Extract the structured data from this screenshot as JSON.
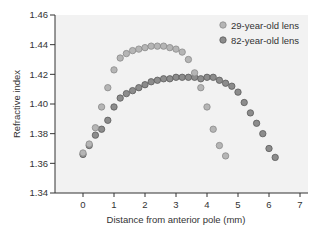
{
  "chart_data": {
    "type": "scatter",
    "title": "",
    "xlabel": "Distance from anterior pole (mm)",
    "ylabel": "Refractive index",
    "xlim": [
      -0.9,
      7
    ],
    "ylim": [
      1.34,
      1.46
    ],
    "x_ticks": [
      "0",
      "1",
      "2",
      "3",
      "4",
      "5",
      "6",
      "7"
    ],
    "y_ticks": [
      "1.34",
      "1.36",
      "1.38",
      "1.40",
      "1.42",
      "1.44",
      "1.46"
    ],
    "grid": false,
    "legend_position": "upper right",
    "series": [
      {
        "name": "29-year-old lens",
        "color": "#a9a9a9",
        "x": [
          0,
          0.2,
          0.4,
          0.6,
          0.8,
          1.0,
          1.2,
          1.4,
          1.6,
          1.8,
          2.0,
          2.2,
          2.4,
          2.6,
          2.8,
          3.0,
          3.2,
          3.4,
          3.6,
          3.8,
          4.0,
          4.2,
          4.4,
          4.6
        ],
        "y": [
          1.367,
          1.373,
          1.384,
          1.398,
          1.411,
          1.423,
          1.431,
          1.434,
          1.436,
          1.437,
          1.438,
          1.439,
          1.439,
          1.439,
          1.438,
          1.437,
          1.435,
          1.43,
          1.421,
          1.411,
          1.398,
          1.383,
          1.372,
          1.365
        ]
      },
      {
        "name": "82-year-old lens",
        "color": "#7e7e7e",
        "x": [
          0,
          0.2,
          0.4,
          0.6,
          0.8,
          1.0,
          1.2,
          1.4,
          1.6,
          1.8,
          2.0,
          2.2,
          2.4,
          2.6,
          2.8,
          3.0,
          3.2,
          3.4,
          3.6,
          3.8,
          4.0,
          4.2,
          4.4,
          4.6,
          4.8,
          5.0,
          5.2,
          5.4,
          5.6,
          5.8,
          6.0,
          6.2
        ],
        "y": [
          1.366,
          1.372,
          1.379,
          1.383,
          1.389,
          1.398,
          1.404,
          1.407,
          1.409,
          1.411,
          1.413,
          1.415,
          1.416,
          1.417,
          1.417,
          1.418,
          1.418,
          1.418,
          1.418,
          1.417,
          1.418,
          1.418,
          1.416,
          1.414,
          1.412,
          1.408,
          1.401,
          1.394,
          1.387,
          1.38,
          1.37,
          1.364
        ]
      }
    ]
  },
  "legend": {
    "items": [
      {
        "label": "29-year-old lens"
      },
      {
        "label": "82-year-old lens"
      }
    ]
  },
  "axes": {
    "xlabel": "Distance from anterior pole (mm)",
    "ylabel": "Refractive index"
  }
}
